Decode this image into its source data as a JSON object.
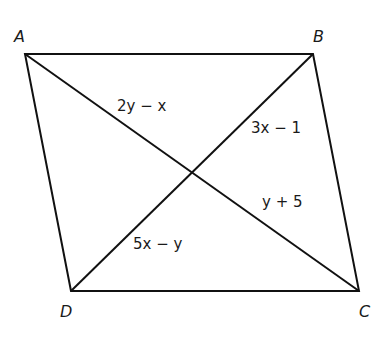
{
  "diagram": {
    "type": "parallelogram-with-diagonals",
    "vertices": {
      "A": {
        "label": "A",
        "x": 25,
        "y": 54
      },
      "B": {
        "label": "B",
        "x": 313,
        "y": 54
      },
      "C": {
        "label": "C",
        "x": 359,
        "y": 291
      },
      "D": {
        "label": "D",
        "x": 71,
        "y": 291
      }
    },
    "segment_labels": {
      "AE": "2y − x",
      "BE": "3x − 1",
      "CE": "y + 5",
      "DE": "5x − y"
    },
    "colors": {
      "stroke": "#111111",
      "text": "#1a1a1a",
      "background": "#ffffff"
    }
  }
}
